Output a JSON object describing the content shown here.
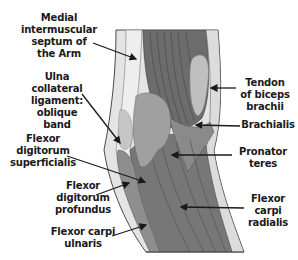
{
  "diagram": {
    "type": "anatomical-illustration",
    "colors": {
      "background": "#ffffff",
      "muscle_dark": "#6e6e6e",
      "muscle_mid": "#858585",
      "muscle_light": "#a2a2a2",
      "tendon": "#c4c4c4",
      "septum": "#e2e2e2",
      "outline": "#4a4a4a",
      "text": "#1a1a1a"
    },
    "labels": [
      {
        "id": "medial-intermuscular-septum",
        "text": "Medial\nintermuscular\nseptum of\nthe Arm"
      },
      {
        "id": "ulna-collateral-ligament",
        "text": "Ulna\ncollateral\nligament:\noblique\nband"
      },
      {
        "id": "flexor-digitorum-superficialis",
        "text": "Flexor\ndigitorum\nsuperficialis"
      },
      {
        "id": "flexor-digitorum-profundus",
        "text": "Flexor\ndigitorum\nprofundus"
      },
      {
        "id": "flexor-carpi-ulnaris",
        "text": "Flexor carpi\nulnaris"
      },
      {
        "id": "tendon-of-biceps-brachii",
        "text": "Tendon\nof biceps\nbrachii"
      },
      {
        "id": "brachialis",
        "text": "Brachialis"
      },
      {
        "id": "pronator-teres",
        "text": "Pronator\nteres"
      },
      {
        "id": "flexor-carpi-radialis",
        "text": "Flexor\ncarpi\nradialis"
      }
    ]
  }
}
